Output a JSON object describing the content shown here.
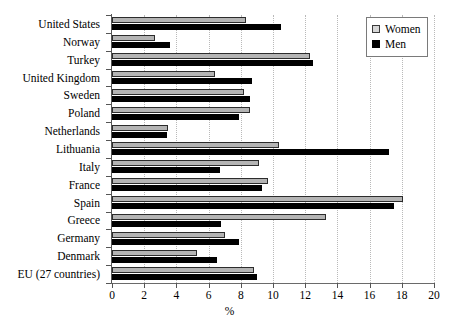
{
  "chart_data": {
    "type": "bar",
    "orientation": "horizontal",
    "title": "",
    "xlabel": "%",
    "ylabel": "",
    "xlim": [
      0,
      20
    ],
    "xticks": [
      0,
      2,
      4,
      6,
      8,
      10,
      12,
      14,
      16,
      18,
      20
    ],
    "grid": true,
    "legend_position": "top-right",
    "categories": [
      "United States",
      "Norway",
      "Turkey",
      "United Kingdom",
      "Sweden",
      "Poland",
      "Netherlands",
      "Lithuania",
      "Italy",
      "France",
      "Spain",
      "Greece",
      "Germany",
      "Denmark",
      "EU (27 countries)"
    ],
    "series": [
      {
        "name": "Women",
        "color": "#b4b4b4",
        "values": [
          8.3,
          2.7,
          12.3,
          6.4,
          8.2,
          8.6,
          3.5,
          10.4,
          9.1,
          9.7,
          18.1,
          13.3,
          7.0,
          5.3,
          8.8
        ]
      },
      {
        "name": "Men",
        "color": "#000000",
        "values": [
          10.5,
          3.6,
          12.5,
          8.7,
          8.6,
          7.9,
          3.4,
          17.2,
          6.7,
          9.3,
          17.5,
          6.8,
          7.9,
          6.5,
          9.0
        ]
      }
    ]
  }
}
